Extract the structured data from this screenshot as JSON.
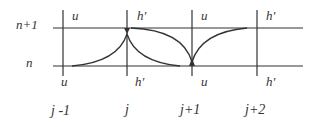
{
  "diagram": {
    "row_labels": {
      "top": "n+1",
      "bottom": "n"
    },
    "column_labels": [
      "j -1",
      "j",
      "j+1",
      "j+2"
    ],
    "top_cell_labels": [
      "u",
      "h'",
      "u",
      "h'"
    ],
    "bottom_cell_labels": [
      "u",
      "h'",
      "u",
      "h'"
    ],
    "colors": {
      "line": "#333333",
      "text": "#333333",
      "background": "#ffffff"
    }
  }
}
